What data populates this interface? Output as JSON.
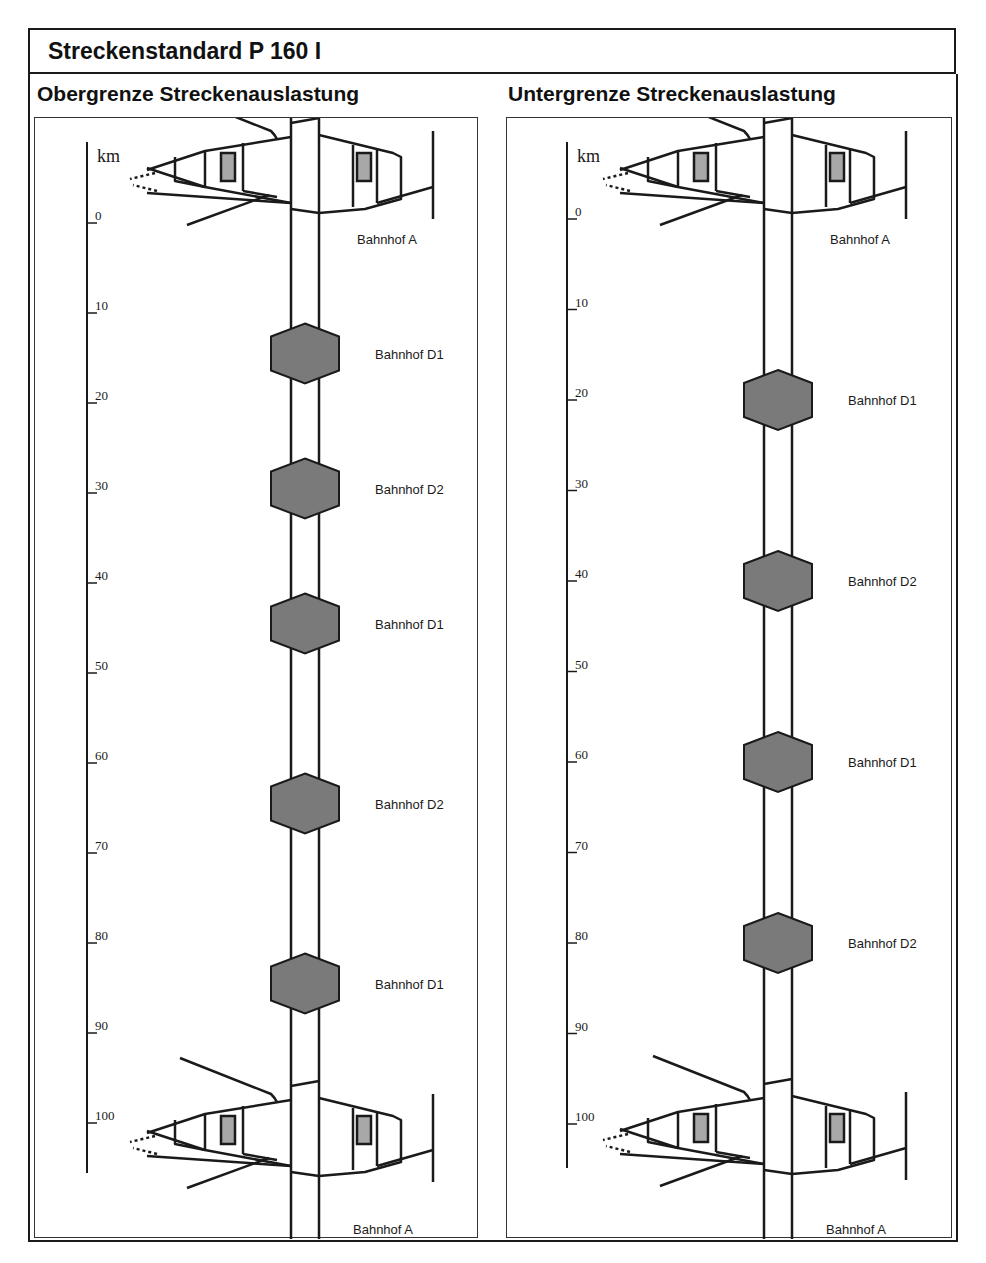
{
  "header": {
    "title": "Streckenstandard P 160 I"
  },
  "panels": [
    {
      "id": "left",
      "title": "Obergrenze Streckenauslastung",
      "scale": {
        "unit": "km",
        "ticks": [
          "0",
          "10",
          "20",
          "30",
          "40",
          "50",
          "60",
          "70",
          "80",
          "90",
          "100"
        ]
      },
      "terminal_top_label": "Bahnhof A",
      "terminal_bottom_label": "Bahnhof A",
      "stations": [
        {
          "label": "Bahnhof D1",
          "km": 14.5
        },
        {
          "label": "Bahnhof D2",
          "km": 29.5
        },
        {
          "label": "Bahnhof D1",
          "km": 44.5
        },
        {
          "label": "Bahnhof D2",
          "km": 64.5
        },
        {
          "label": "Bahnhof D1",
          "km": 84.5
        }
      ]
    },
    {
      "id": "right",
      "title": "Untergrenze Streckenauslastung",
      "scale": {
        "unit": "km",
        "ticks": [
          "0",
          "10",
          "20",
          "30",
          "40",
          "50",
          "60",
          "70",
          "80",
          "90",
          "100"
        ]
      },
      "terminal_top_label": "Bahnhof A",
      "terminal_bottom_label": "Bahnhof A",
      "stations": [
        {
          "label": "Bahnhof D1",
          "km": 20
        },
        {
          "label": "Bahnhof D2",
          "km": 40
        },
        {
          "label": "Bahnhof D1",
          "km": 60
        },
        {
          "label": "Bahnhof D2",
          "km": 80
        }
      ]
    }
  ],
  "colors": {
    "line": "#1a1a1a",
    "station_fill": "#7a7a7a",
    "platform_fill": "#a8a8a8"
  }
}
